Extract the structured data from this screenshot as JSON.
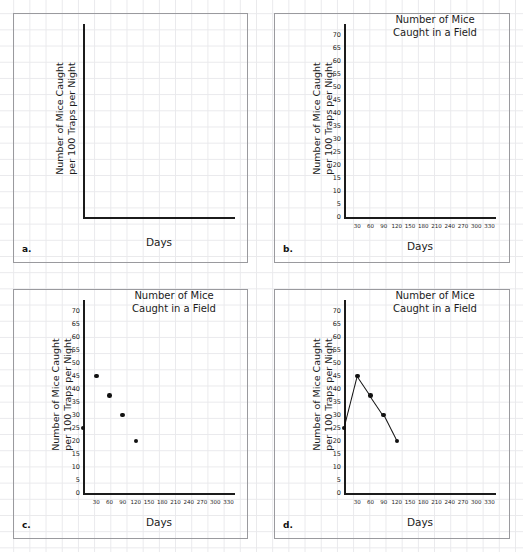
{
  "figure": {
    "title": "Number of Mice\nCaught in a Field",
    "xlabel": "Days",
    "ylabel": "Number of Mice Caught\nper 100 Traps per Night"
  },
  "panels": [
    {
      "letter": "a.",
      "name": "panel-a-blank-axes",
      "title": "",
      "show_title": false,
      "show_ticks": false,
      "mode": "blank",
      "xlabel": "Days",
      "ylabel": "Number of Mice Caught\nper 100 Traps per Night"
    },
    {
      "letter": "b.",
      "name": "panel-b-labeled-axes",
      "title": "Number of Mice\nCaught in a Field",
      "show_title": true,
      "show_ticks": true,
      "mode": "empty",
      "xlabel": "Days",
      "ylabel": "Number of Mice Caught\nper 100 Traps per Night"
    },
    {
      "letter": "c.",
      "name": "panel-c-scatter",
      "title": "Number of Mice\nCaught in a Field",
      "show_title": true,
      "show_ticks": true,
      "mode": "scatter",
      "xlabel": "Days",
      "ylabel": "Number of Mice Caught\nper 100 Traps per Night"
    },
    {
      "letter": "d.",
      "name": "panel-d-line",
      "title": "Number of Mice\nCaught in a Field",
      "show_title": true,
      "show_ticks": true,
      "mode": "line",
      "xlabel": "Days",
      "ylabel": "Number of Mice Caught\nper 100 Traps per Night"
    }
  ],
  "chart_data": {
    "type": "scatter",
    "title": "Number of Mice Caught in a Field",
    "xlabel": "Days",
    "ylabel": "Number of Mice Caught per 100 Traps per Night",
    "x": [
      0,
      30,
      60,
      90,
      120
    ],
    "values": [
      25,
      45,
      37.5,
      30,
      20
    ],
    "xlim": [
      0,
      345
    ],
    "ylim": [
      0,
      73
    ],
    "xticks": [
      30,
      60,
      90,
      120,
      150,
      180,
      210,
      240,
      270,
      300,
      330
    ],
    "yticks": [
      0,
      5,
      10,
      15,
      20,
      25,
      30,
      35,
      40,
      45,
      50,
      55,
      60,
      65,
      70
    ],
    "grid": true,
    "legend": "none",
    "series": [
      {
        "name": "Mice caught",
        "points": [
          {
            "x": 0,
            "y": 25
          },
          {
            "x": 30,
            "y": 45
          },
          {
            "x": 60,
            "y": 37.5
          },
          {
            "x": 90,
            "y": 30
          },
          {
            "x": 120,
            "y": 20
          }
        ]
      }
    ]
  }
}
